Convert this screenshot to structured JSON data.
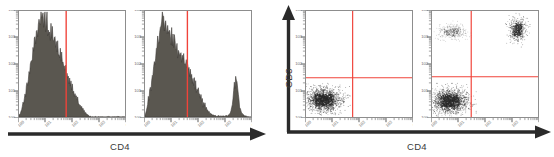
{
  "figure": {
    "type": "flow-cytometry-figure",
    "panel_count": 4,
    "background_color": "#ffffff",
    "histogram_fill_color": "#5a5750",
    "histogram_stroke_color": "#3d3b36",
    "gate_line_color": "#f0433a",
    "panel_border_color": "#8d8d8d",
    "dot_color": "#2b2b2b",
    "axis_arrow_color": "#2a2a2a"
  },
  "groups": {
    "histograms": {
      "name": "histogram-group",
      "x_axis_label": "CD4",
      "y_axis_label": "",
      "arrow_direction": "right"
    },
    "dotplots": {
      "name": "dotplot-group",
      "x_axis_label": "CD4",
      "y_axis_label": "CD3",
      "arrow_direction": "right-and-up"
    }
  },
  "axis_ticks": {
    "x_decades": [
      "10^0",
      "10^1",
      "10^2",
      "10^3",
      "10^4"
    ],
    "y_decades": [
      "10^0",
      "10^1",
      "10^2",
      "10^3",
      "10^4"
    ],
    "scale": "log",
    "tick_label_rendering": "rotated-small-superscript"
  },
  "chart_data": [
    {
      "type": "histogram",
      "panel_index": 0,
      "name": "panel-1-histogram-cd4-negative",
      "title": "",
      "xlabel": "CD4",
      "ylabel": "Count",
      "x_scale": "log",
      "xlim": [
        0,
        1
      ],
      "ylim": [
        0,
        1
      ],
      "gate": {
        "type": "vertical-line",
        "x": 0.445,
        "color": "#f0433a"
      },
      "populations": [
        {
          "name": "CD4-negative",
          "peak_x": 0.13,
          "fraction": 1.0,
          "side": "left-of-gate"
        }
      ],
      "values": [
        0.02,
        0.03,
        0.03,
        0.05,
        0.07,
        0.1,
        0.14,
        0.12,
        0.18,
        0.23,
        0.2,
        0.28,
        0.34,
        0.3,
        0.38,
        0.45,
        0.4,
        0.49,
        0.56,
        0.52,
        0.6,
        0.66,
        0.62,
        0.7,
        0.75,
        0.71,
        0.78,
        0.84,
        0.8,
        0.88,
        0.95,
        0.86,
        0.93,
        0.99,
        0.9,
        0.96,
        1.0,
        0.89,
        0.94,
        0.98,
        0.87,
        0.92,
        0.97,
        0.85,
        0.91,
        0.83,
        0.88,
        0.8,
        0.86,
        0.78,
        0.83,
        0.75,
        0.8,
        0.72,
        0.77,
        0.69,
        0.74,
        0.66,
        0.7,
        0.62,
        0.67,
        0.59,
        0.63,
        0.55,
        0.6,
        0.52,
        0.56,
        0.48,
        0.52,
        0.45,
        0.49,
        0.41,
        0.45,
        0.38,
        0.42,
        0.34,
        0.38,
        0.31,
        0.34,
        0.27,
        0.3,
        0.24,
        0.27,
        0.21,
        0.23,
        0.18,
        0.2,
        0.15,
        0.17,
        0.13,
        0.14,
        0.11,
        0.12,
        0.09,
        0.1,
        0.07,
        0.08,
        0.06,
        0.06,
        0.04,
        0.04,
        0.03,
        0.03,
        0.02,
        0.02,
        0.01,
        0.01,
        0.01,
        0.0,
        0.0,
        0.0,
        0.0,
        0.0,
        0.0,
        0.0,
        0.0,
        0.0,
        0.0,
        0.0,
        0.0,
        0.0,
        0.0,
        0.0,
        0.0,
        0.0,
        0.0,
        0.0,
        0.0,
        0.0,
        0.0,
        0.0,
        0.0,
        0.0,
        0.0,
        0.0,
        0.0,
        0.0,
        0.0,
        0.0,
        0.0,
        0.0,
        0.0,
        0.0,
        0.0,
        0.0,
        0.0,
        0.0,
        0.0,
        0.0,
        0.0,
        0.0,
        0.0,
        0.0,
        0.0,
        0.0,
        0.0,
        0.0,
        0.0,
        0.0,
        0.0
      ]
    },
    {
      "type": "histogram",
      "panel_index": 1,
      "name": "panel-2-histogram-cd4-bimodal",
      "title": "",
      "xlabel": "CD4",
      "ylabel": "Count",
      "x_scale": "log",
      "xlim": [
        0,
        1
      ],
      "ylim": [
        0,
        1
      ],
      "gate": {
        "type": "vertical-line",
        "x": 0.4,
        "color": "#f0433a"
      },
      "populations": [
        {
          "name": "CD4-negative",
          "peak_x": 0.15,
          "fraction": 0.82,
          "side": "left-of-gate"
        },
        {
          "name": "CD4-positive",
          "peak_x": 0.8,
          "fraction": 0.18,
          "side": "right-of-gate"
        }
      ],
      "values": [
        0.02,
        0.04,
        0.06,
        0.09,
        0.13,
        0.18,
        0.16,
        0.24,
        0.3,
        0.27,
        0.36,
        0.43,
        0.39,
        0.48,
        0.55,
        0.51,
        0.6,
        0.67,
        0.63,
        0.72,
        0.79,
        0.74,
        0.83,
        0.9,
        0.85,
        0.93,
        1.0,
        0.92,
        0.97,
        0.89,
        0.95,
        0.87,
        0.91,
        0.84,
        0.88,
        0.81,
        0.85,
        0.78,
        0.82,
        0.76,
        0.8,
        0.73,
        0.77,
        0.7,
        0.75,
        0.68,
        0.72,
        0.65,
        0.7,
        0.63,
        0.68,
        0.61,
        0.66,
        0.59,
        0.64,
        0.57,
        0.62,
        0.55,
        0.6,
        0.53,
        0.57,
        0.5,
        0.54,
        0.47,
        0.51,
        0.44,
        0.48,
        0.41,
        0.45,
        0.38,
        0.42,
        0.35,
        0.39,
        0.32,
        0.36,
        0.29,
        0.33,
        0.26,
        0.29,
        0.23,
        0.26,
        0.2,
        0.23,
        0.17,
        0.2,
        0.15,
        0.17,
        0.12,
        0.14,
        0.1,
        0.12,
        0.08,
        0.09,
        0.07,
        0.07,
        0.05,
        0.05,
        0.04,
        0.04,
        0.03,
        0.03,
        0.02,
        0.02,
        0.02,
        0.01,
        0.01,
        0.01,
        0.01,
        0.01,
        0.01,
        0.01,
        0.01,
        0.01,
        0.01,
        0.01,
        0.01,
        0.01,
        0.01,
        0.01,
        0.01,
        0.01,
        0.01,
        0.01,
        0.01,
        0.01,
        0.02,
        0.02,
        0.03,
        0.04,
        0.06,
        0.09,
        0.13,
        0.19,
        0.27,
        0.35,
        0.3,
        0.42,
        0.38,
        0.33,
        0.26,
        0.2,
        0.15,
        0.11,
        0.08,
        0.06,
        0.04,
        0.03,
        0.02,
        0.02,
        0.01,
        0.01,
        0.01,
        0.01,
        0.0,
        0.0,
        0.0,
        0.0,
        0.0,
        0.0,
        0.0
      ]
    },
    {
      "type": "scatter",
      "panel_index": 2,
      "name": "panel-3-dotplot-cd3-vs-cd4-single-population",
      "title": "",
      "xlabel": "CD4",
      "ylabel": "CD3",
      "x_scale": "log",
      "y_scale": "log",
      "xlim": [
        0,
        1
      ],
      "ylim": [
        0,
        1
      ],
      "quadrant_gate": {
        "x": 0.44,
        "y": 0.37,
        "color": "#f0433a"
      },
      "clusters": [
        {
          "name": "CD3-negative-CD4-negative",
          "quadrant": "lower-left",
          "cx": 0.17,
          "cy": 0.16,
          "sx": 0.085,
          "sy": 0.055,
          "n": 1700,
          "density": "high"
        }
      ]
    },
    {
      "type": "scatter",
      "panel_index": 3,
      "name": "panel-4-dotplot-cd3-vs-cd4-three-populations",
      "title": "",
      "xlabel": "CD4",
      "ylabel": "CD3",
      "x_scale": "log",
      "y_scale": "log",
      "xlim": [
        0,
        1
      ],
      "ylim": [
        0,
        1
      ],
      "quadrant_gate": {
        "x": 0.37,
        "y": 0.38,
        "color": "#f0433a"
      },
      "clusters": [
        {
          "name": "CD3-negative-CD4-negative",
          "quadrant": "lower-left",
          "cx": 0.17,
          "cy": 0.15,
          "sx": 0.085,
          "sy": 0.058,
          "n": 1700,
          "density": "high"
        },
        {
          "name": "CD3-positive-CD4-negative",
          "quadrant": "upper-left",
          "cx": 0.19,
          "cy": 0.8,
          "sx": 0.075,
          "sy": 0.038,
          "n": 300,
          "density": "low"
        },
        {
          "name": "CD3-positive-CD4-positive",
          "quadrant": "upper-right",
          "cx": 0.81,
          "cy": 0.82,
          "sx": 0.04,
          "sy": 0.055,
          "n": 520,
          "density": "high"
        }
      ]
    }
  ]
}
